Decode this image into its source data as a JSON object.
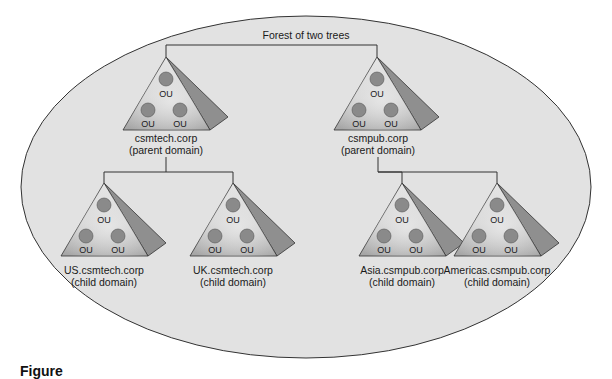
{
  "diagram": {
    "title": "Forest of two trees",
    "colors": {
      "forest_fill": "#e2e2e2",
      "outline": "#333333",
      "pyramid_front_light": "#dcdcdc",
      "pyramid_front_dark": "#a9a9a9",
      "pyramid_side": "#8f8f8f",
      "ou_fill": "#8a8a8a"
    },
    "ou_label": "OU",
    "trees": [
      {
        "parent": {
          "name": "csmtech.corp",
          "role": "(parent domain)",
          "ous": [
            "OU",
            "OU",
            "OU"
          ]
        },
        "children": [
          {
            "name": "US.csmtech.corp",
            "role": "(child domain)",
            "ous": [
              "OU",
              "OU",
              "OU"
            ]
          },
          {
            "name": "UK.csmtech.corp",
            "role": "(child domain)",
            "ous": [
              "OU",
              "OU",
              "OU"
            ]
          }
        ]
      },
      {
        "parent": {
          "name": "csmpub.corp",
          "role": "(parent domain)",
          "ous": [
            "OU",
            "OU",
            "OU"
          ]
        },
        "children": [
          {
            "name": "Asia.csmpub.corp",
            "role": "(child domain)",
            "ous": [
              "OU",
              "OU",
              "OU"
            ]
          },
          {
            "name": "Americas.csmpub.corp",
            "role": "(child domain)",
            "ous": [
              "OU",
              "OU",
              "OU"
            ]
          }
        ]
      }
    ],
    "caption": "Figure"
  }
}
